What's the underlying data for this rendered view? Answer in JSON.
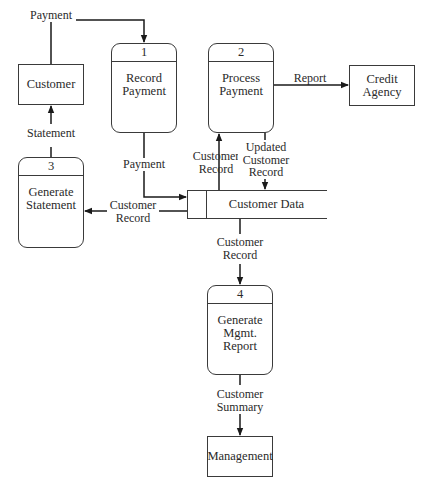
{
  "diagram": {
    "type": "data-flow-diagram",
    "external_entities": [
      {
        "id": "customer",
        "label": "Customer"
      },
      {
        "id": "credit_agency",
        "label": "Credit\nAgency"
      },
      {
        "id": "management",
        "label": "Management"
      }
    ],
    "processes": [
      {
        "number": "1",
        "label": "Record\nPayment"
      },
      {
        "number": "2",
        "label": "Process\nPayment"
      },
      {
        "number": "3",
        "label": "Generate\nStatement"
      },
      {
        "number": "4",
        "label": "Generate\nMgmt.\nReport"
      }
    ],
    "data_stores": [
      {
        "id": "customer_data",
        "label": "Customer Data"
      }
    ],
    "flows": [
      {
        "from": "Customer",
        "to": "Record Payment",
        "label": "Payment"
      },
      {
        "from": "Record Payment",
        "to": "Customer Data",
        "label": "Payment"
      },
      {
        "from": "Customer Data",
        "to": "Process Payment",
        "label": "Customer\nRecord"
      },
      {
        "from": "Process Payment",
        "to": "Customer Data",
        "label": "Updated\nCustomer\nRecord"
      },
      {
        "from": "Process Payment",
        "to": "Credit Agency",
        "label": "Report"
      },
      {
        "from": "Customer Data",
        "to": "Generate Statement",
        "label": "Customer\nRecord"
      },
      {
        "from": "Generate Statement",
        "to": "Customer",
        "label": "Statement"
      },
      {
        "from": "Customer Data",
        "to": "Generate Mgmt. Report",
        "label": "Customer\nRecord"
      },
      {
        "from": "Generate Mgmt. Report",
        "to": "Management",
        "label": "Customer\nSummary"
      }
    ]
  }
}
